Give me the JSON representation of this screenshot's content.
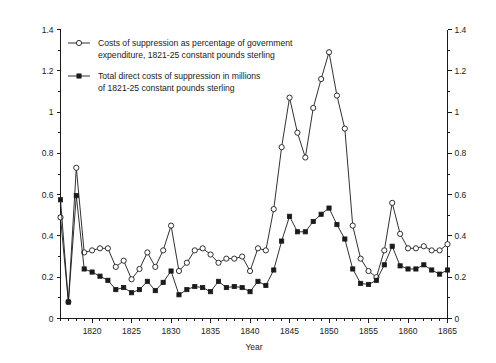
{
  "chart_data": {
    "type": "line",
    "title": "",
    "xlabel": "Year",
    "ylabel": "",
    "xlim": [
      1816,
      1865
    ],
    "ylim": [
      0,
      1.4
    ],
    "grid": false,
    "legend_position": "top-left",
    "x_ticks_major": [
      1820,
      1825,
      1830,
      1835,
      1840,
      1845,
      1850,
      1855,
      1860,
      1865
    ],
    "x_tick_labels": [
      "1820",
      "1825",
      "1830",
      "1835",
      "1840",
      "1845",
      "1850",
      "1855",
      "1860",
      "1865"
    ],
    "x_ticks_minor_step": 1,
    "y_ticks_major": [
      0,
      0.2,
      0.4,
      0.6,
      0.8,
      1,
      1.2,
      1.4
    ],
    "y_tick_labels": [
      "0",
      "0.2",
      "0.4",
      "0.6",
      "0.8",
      "1",
      "1.2",
      "1.4"
    ],
    "y_ticks_minor_step": 0.1,
    "left_axis_labels": [
      "0",
      "0.2",
      "0.4",
      "0.6",
      "0.8",
      "1",
      "1.2",
      "1.4"
    ],
    "right_axis_labels": [
      "0",
      "0.2",
      "0.4",
      "0.6",
      "0.8",
      "1",
      "1.2",
      "1.4"
    ],
    "x": [
      1816,
      1817,
      1818,
      1819,
      1820,
      1821,
      1822,
      1823,
      1824,
      1825,
      1826,
      1827,
      1828,
      1829,
      1830,
      1831,
      1832,
      1833,
      1834,
      1835,
      1836,
      1837,
      1838,
      1839,
      1840,
      1841,
      1842,
      1843,
      1844,
      1845,
      1846,
      1847,
      1848,
      1849,
      1850,
      1851,
      1852,
      1853,
      1854,
      1855,
      1856,
      1857,
      1858,
      1859,
      1860,
      1861,
      1862,
      1863,
      1864,
      1865
    ],
    "series": [
      {
        "name": "Costs of suppression as percentage of government expenditure, 1821-25 constant pounds sterling",
        "marker": "open-circle",
        "values": [
          0.49,
          0.08,
          0.73,
          0.32,
          0.33,
          0.34,
          0.34,
          0.25,
          0.28,
          0.19,
          0.24,
          0.32,
          0.25,
          0.33,
          0.45,
          0.23,
          0.27,
          0.33,
          0.34,
          0.31,
          0.27,
          0.29,
          0.29,
          0.3,
          0.23,
          0.34,
          0.33,
          0.53,
          0.83,
          1.07,
          0.9,
          0.78,
          1.02,
          1.16,
          1.29,
          1.08,
          0.92,
          0.45,
          0.29,
          0.23,
          0.2,
          0.33,
          0.56,
          0.41,
          0.34,
          0.34,
          0.35,
          0.33,
          0.33,
          0.36
        ]
      },
      {
        "name": "Total direct costs of suppression in millions of 1821-25 constant pounds sterling",
        "marker": "filled-square",
        "values": [
          0.575,
          0.08,
          0.595,
          0.24,
          0.225,
          0.205,
          0.185,
          0.14,
          0.15,
          0.125,
          0.14,
          0.18,
          0.135,
          0.175,
          0.23,
          0.115,
          0.14,
          0.155,
          0.15,
          0.13,
          0.18,
          0.15,
          0.155,
          0.15,
          0.13,
          0.18,
          0.16,
          0.235,
          0.375,
          0.495,
          0.42,
          0.42,
          0.47,
          0.505,
          0.535,
          0.455,
          0.385,
          0.24,
          0.17,
          0.165,
          0.185,
          0.26,
          0.35,
          0.255,
          0.24,
          0.24,
          0.26,
          0.235,
          0.215,
          0.235
        ]
      }
    ]
  },
  "legend": {
    "entries": [
      {
        "marker": "open-circle",
        "line1": "Costs of suppression as percentage of government",
        "line2": "expenditure, 1821-25 constant pounds sterling"
      },
      {
        "marker": "filled-square",
        "line1": "Total direct costs of suppression in millions",
        "line2": "of 1821-25 constant pounds sterling"
      }
    ]
  },
  "axes": {
    "x_title": "Year"
  },
  "colors": {
    "ink": "#1a1a1a",
    "background": "#ffffff"
  }
}
